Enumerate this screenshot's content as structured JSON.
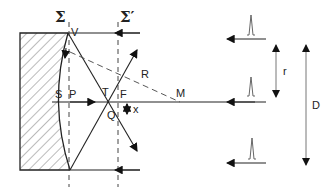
{
  "diagram": {
    "type": "optics-mirror-focusing",
    "labels": {
      "sigma": "Σ",
      "sigma_prime": "Σ′",
      "V": "V",
      "S": "S",
      "P": "P",
      "T": "T",
      "F": "F",
      "Q": "Q",
      "R": "R",
      "M": "M",
      "x": "x",
      "r": "r",
      "D": "D"
    },
    "colors": {
      "line": "#222222",
      "hatch": "#555555",
      "dashed": "#444444",
      "arrow_gray": "#777777"
    },
    "incoming_beams": 3,
    "pulse_markers": 3
  }
}
